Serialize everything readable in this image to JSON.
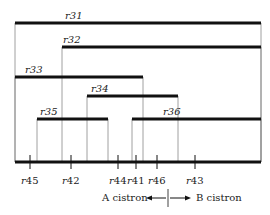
{
  "diagram": {
    "title": "",
    "deletions": [
      {
        "label": "r31",
        "x1": 15,
        "x2": 261,
        "y": 23,
        "label_x": 65
      },
      {
        "label": "r32",
        "x1": 62,
        "x2": 261,
        "y": 47,
        "label_x": 63
      },
      {
        "label": "r33",
        "x1": 15,
        "x2": 143,
        "y": 77,
        "label_x": 25
      },
      {
        "label": "r34",
        "x1": 87,
        "x2": 178,
        "y": 96,
        "label_x": 91
      },
      {
        "label": "r35",
        "x1": 37,
        "x2": 108,
        "y": 119,
        "label_x": 40
      },
      {
        "label": "r36",
        "x1": 132,
        "x2": 261,
        "y": 119,
        "label_x": 163
      }
    ],
    "axis": {
      "x1": 15,
      "x2": 261,
      "y": 162
    },
    "point_mutations": [
      {
        "label": "r45",
        "x": 30
      },
      {
        "label": "r42",
        "x": 71
      },
      {
        "label": "r44",
        "x": 118
      },
      {
        "label": "r41",
        "x": 136
      },
      {
        "label": "r46",
        "x": 157
      },
      {
        "label": "r43",
        "x": 195
      }
    ],
    "cistron_labels": {
      "left": "A cistron",
      "right": "B cistron"
    }
  }
}
